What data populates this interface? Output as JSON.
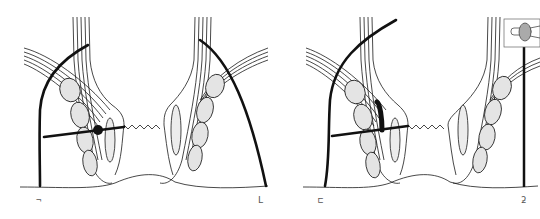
{
  "figure": {
    "colors": {
      "line": "#1a1a1a",
      "muscle_fill": "#e4e4e4",
      "stipple_fill": "#ececec",
      "background": "#ffffff"
    }
  },
  "panels": [
    {
      "id": "left",
      "labels": [
        {
          "text": "¬",
          "position": "bottom-left"
        },
        {
          "text": "L",
          "position": "bottom-right"
        }
      ]
    },
    {
      "id": "right",
      "labels": [
        {
          "text": "⊏",
          "position": "bottom-left"
        },
        {
          "text": "ƻ",
          "position": "bottom-right"
        }
      ],
      "inset": "probe-with-handle"
    }
  ]
}
